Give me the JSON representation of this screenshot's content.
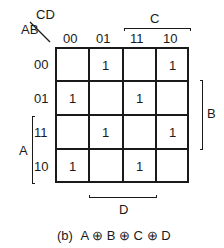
{
  "kmap": {
    "corner": {
      "row_vars": "AB",
      "col_vars": "CD"
    },
    "col_headers": [
      "00",
      "01",
      "11",
      "10"
    ],
    "row_headers": [
      "00",
      "01",
      "11",
      "10"
    ],
    "cells": [
      [
        "",
        "1",
        "",
        "1"
      ],
      [
        "1",
        "",
        "1",
        ""
      ],
      [
        "",
        "1",
        "",
        "1"
      ],
      [
        "1",
        "",
        "1",
        ""
      ]
    ],
    "brackets": {
      "C": "C",
      "B": "B",
      "A": "A",
      "D": "D"
    }
  },
  "caption": {
    "prefix": "(b)",
    "expression": "A ⊕ B ⊕ C ⊕ D"
  }
}
